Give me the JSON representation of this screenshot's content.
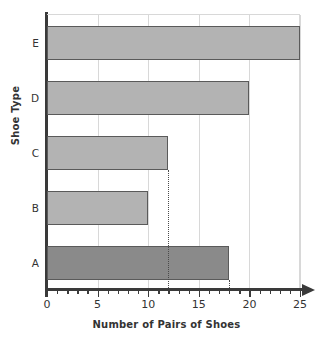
{
  "chart_data": {
    "type": "bar",
    "orientation": "horizontal",
    "title": "",
    "xlabel": "Number of Pairs of Shoes",
    "ylabel": "Shoe Type",
    "categories": [
      "A",
      "B",
      "C",
      "D",
      "E"
    ],
    "values": [
      18,
      10,
      12,
      20,
      25
    ],
    "xlim": [
      0,
      25
    ],
    "xticks": [
      0,
      5,
      10,
      15,
      20,
      25
    ],
    "xtick_labels": [
      "0",
      "5",
      "10",
      "15",
      "20",
      "25"
    ],
    "minor_tick_step": 1,
    "grid": "vertical-major",
    "legend": "none",
    "annotations": [
      {
        "type": "dotted-vertical-reference",
        "x": 12,
        "from_category": "C"
      },
      {
        "type": "dotted-vertical-reference",
        "x": 18,
        "from_category": "A"
      }
    ],
    "colors": {
      "bar_default": "#b3b3b3",
      "bar_highlight": "#8a8a8a",
      "bar_border": "#5a5a5a",
      "axis": "#3a3a3a",
      "grid": "#d8d8d8",
      "background": "#ffffff",
      "text": "#333333"
    },
    "bar_colors": [
      "#8a8a8a",
      "#b3b3b3",
      "#b3b3b3",
      "#b3b3b3",
      "#b3b3b3"
    ]
  }
}
